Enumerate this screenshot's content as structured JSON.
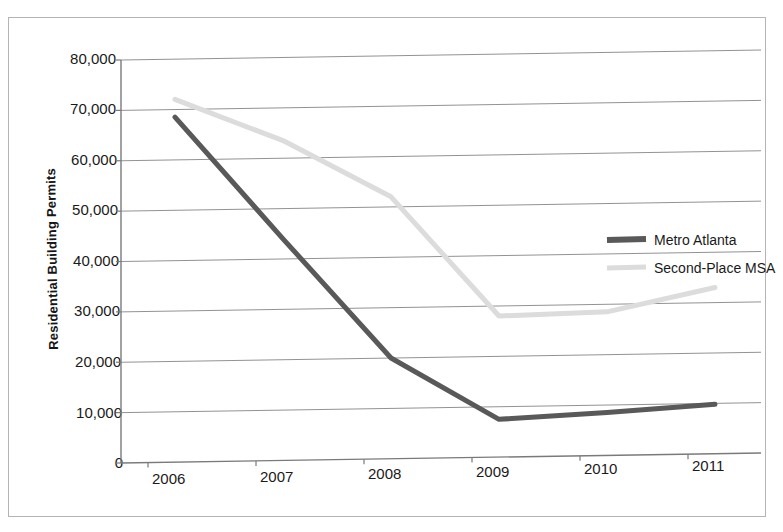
{
  "chart_data": {
    "type": "line",
    "title": "",
    "xlabel": "",
    "ylabel": "Residential Building Permits",
    "categories": [
      "2006",
      "2007",
      "2008",
      "2009",
      "2010",
      "2011"
    ],
    "x": [
      2006,
      2007,
      2008,
      2009,
      2010,
      2011
    ],
    "ylim": [
      0,
      80000
    ],
    "y_ticks": [
      "0",
      "10,000",
      "20,000",
      "30,000",
      "40,000",
      "50,000",
      "60,000",
      "70,000",
      "80,000"
    ],
    "y_tick_values": [
      0,
      10000,
      20000,
      30000,
      40000,
      50000,
      60000,
      70000,
      80000
    ],
    "grid": "horizontal",
    "legend_position": "right-middle",
    "series": [
      {
        "name": "Metro Atlanta",
        "color": "#595959",
        "values": [
          68500,
          44000,
          20000,
          7500,
          8500,
          9800
        ]
      },
      {
        "name": "Second-Place MSA",
        "color": "#dcdcdc",
        "values": [
          72000,
          63500,
          52000,
          28000,
          28500,
          33000
        ]
      }
    ]
  },
  "axis": {
    "y_title": "Residential Building Permits",
    "y_ticks": [
      "80,000",
      "70,000",
      "60,000",
      "50,000",
      "40,000",
      "30,000",
      "20,000",
      "10,000",
      "0"
    ],
    "x_ticks": [
      "2006",
      "2007",
      "2008",
      "2009",
      "2010",
      "2011"
    ]
  },
  "legend": {
    "items": [
      {
        "label": "Metro Atlanta",
        "color": "#595959"
      },
      {
        "label": "Second-Place MSA",
        "color": "#dcdcdc"
      }
    ]
  },
  "colors": {
    "metro_atlanta": "#595959",
    "second_place_msa": "#dcdcdc",
    "gridline": "#808080",
    "axis": "#7a7a7a",
    "frame": "#b4b4b4",
    "text": "#1a1a1a"
  }
}
